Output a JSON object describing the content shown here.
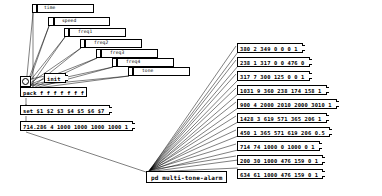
{
  "patch": {
    "title": "multi-tone-alarm",
    "subpatch_label": "pd multi-tone-alarm",
    "colors": {
      "line": "#000000",
      "box_fill": "#ffffff",
      "box_border": "#000000"
    }
  },
  "sliders": [
    {
      "name": "time",
      "label": "time",
      "x": 32,
      "y": 4,
      "w": 62,
      "knob": 3
    },
    {
      "name": "speed",
      "label": "speed",
      "x": 48,
      "y": 17,
      "w": 62,
      "knob": 4
    },
    {
      "name": "freq1",
      "label": "freq1",
      "x": 64,
      "y": 28,
      "w": 62,
      "knob": 3
    },
    {
      "name": "freq2",
      "label": "freq2",
      "x": 80,
      "y": 39,
      "w": 62,
      "knob": 3
    },
    {
      "name": "freq3",
      "label": "freq3",
      "x": 96,
      "y": 49,
      "w": 62,
      "knob": 3
    },
    {
      "name": "freq4",
      "label": "freq4",
      "x": 112,
      "y": 58,
      "w": 62,
      "knob": 3
    },
    {
      "name": "tone",
      "label": "tone",
      "x": 128,
      "y": 67,
      "w": 62,
      "knob": 3
    }
  ],
  "bang": {
    "name": "init-bang"
  },
  "init_msg": {
    "text": "init"
  },
  "pack_obj": {
    "text": "pack f f f f f f f"
  },
  "set_msg": {
    "text": "set $1 $2 $3 $4 $5 $6 $7"
  },
  "default_msg": {
    "text": "714.286 4 1000 1000 1000 1000 1"
  },
  "presets": [
    {
      "text": "380 2 349 0 0 0 1"
    },
    {
      "text": "238 1 317 0 0 476 0"
    },
    {
      "text": "317 7 300 125 0 0 1"
    },
    {
      "text": "1031 9 360 238 174 158 1"
    },
    {
      "text": "900 4 2000 2010 2000 3010 1"
    },
    {
      "text": "1428 3 619 571 365 206 1"
    },
    {
      "text": "450 1 365 571 619 206 0.5"
    },
    {
      "text": "714 74 1000 0 1000 0 1"
    },
    {
      "text": "200 30 1000 476 159 0 1"
    },
    {
      "text": "634 61 1000 476 159 0 1"
    }
  ]
}
